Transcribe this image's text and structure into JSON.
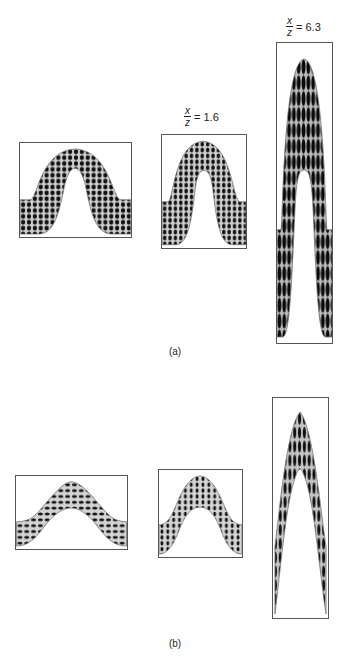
{
  "figure": {
    "parts": [
      {
        "label": "(a)",
        "description": "Folded layer with circular/elliptical strain markers, parallel (class 1B) fold",
        "panels": [
          {
            "id": "a1",
            "ratio_label": null,
            "marker_style": "dots"
          },
          {
            "id": "a2",
            "ratio_label": {
              "numerator": "x",
              "denominator": "z",
              "value": "= 1.6"
            },
            "marker_style": "dots"
          },
          {
            "id": "a3",
            "ratio_label": {
              "numerator": "x",
              "denominator": "z",
              "value": "= 6.3"
            },
            "marker_style": "elongated"
          }
        ]
      },
      {
        "label": "(b)",
        "description": "Folded layer with strain markers, similar-style fold",
        "panels": [
          {
            "id": "b1",
            "ratio_label": null,
            "marker_style": "dashes"
          },
          {
            "id": "b2",
            "ratio_label": null,
            "marker_style": "dashes"
          },
          {
            "id": "b3",
            "ratio_label": null,
            "marker_style": "elongated"
          }
        ]
      }
    ],
    "colors": {
      "frame": "#555555",
      "fill": "#cfcfcf",
      "marker": "#111111",
      "background": "#ffffff"
    }
  }
}
